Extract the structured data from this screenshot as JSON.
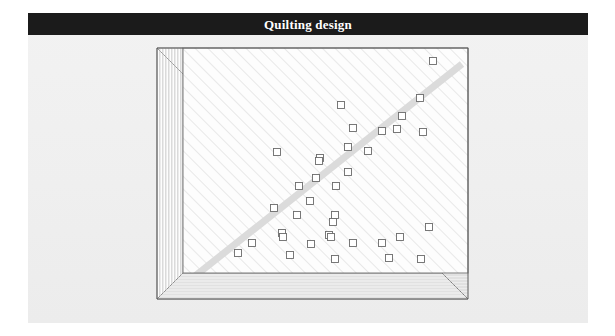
{
  "page": {
    "background_color": "#ffffff",
    "panel_color": "#f0f0f0",
    "width": 615,
    "height": 336
  },
  "titlebar": {
    "title": "Quilting design",
    "background_color": "#1b1b1b",
    "text_color": "#ffffff"
  },
  "diagram": {
    "name": "quilt-layout-diagram",
    "outline_color": "#555555",
    "hatch_color": "#e2e2e2",
    "field_color": "#fdfdfd",
    "border_strip_color": "#fcfcfc",
    "stitch_band_color": "#dadada",
    "square_stroke_color": "#6b6b6b",
    "square_fill_color": "#ffffff",
    "square_size": 7,
    "geometry": {
      "outer": {
        "x": 7,
        "y": 6,
        "w": 311,
        "h": 251
      },
      "field": {
        "x": 33,
        "y": 6,
        "w": 285,
        "h": 225
      },
      "left_border": {
        "x": 7,
        "y": 6,
        "w": 26,
        "h": 251
      },
      "bottom_border": {
        "x": 7,
        "y": 231,
        "w": 311,
        "h": 26
      },
      "hatch_spacing": 9,
      "hatch_angle_deg": 45,
      "left_border_line_count": 9,
      "bottom_border_line_count": 9
    },
    "stitch_band": {
      "x1": 40,
      "y1": 238,
      "x2": 312,
      "y2": 22,
      "width": 7
    },
    "squares": [
      {
        "x": 433,
        "y": 61
      },
      {
        "x": 420,
        "y": 98
      },
      {
        "x": 341,
        "y": 105
      },
      {
        "x": 402,
        "y": 116
      },
      {
        "x": 353,
        "y": 128
      },
      {
        "x": 382,
        "y": 131
      },
      {
        "x": 397,
        "y": 129
      },
      {
        "x": 423,
        "y": 132
      },
      {
        "x": 348,
        "y": 147
      },
      {
        "x": 368,
        "y": 151
      },
      {
        "x": 320,
        "y": 158
      },
      {
        "x": 277,
        "y": 152
      },
      {
        "x": 319,
        "y": 161
      },
      {
        "x": 348,
        "y": 172
      },
      {
        "x": 316,
        "y": 178
      },
      {
        "x": 299,
        "y": 186
      },
      {
        "x": 336,
        "y": 186
      },
      {
        "x": 310,
        "y": 201
      },
      {
        "x": 274,
        "y": 208
      },
      {
        "x": 297,
        "y": 215
      },
      {
        "x": 335,
        "y": 215
      },
      {
        "x": 282,
        "y": 233
      },
      {
        "x": 329,
        "y": 235
      },
      {
        "x": 333,
        "y": 222
      },
      {
        "x": 429,
        "y": 227
      },
      {
        "x": 283,
        "y": 237
      },
      {
        "x": 252,
        "y": 243
      },
      {
        "x": 331,
        "y": 237
      },
      {
        "x": 400,
        "y": 237
      },
      {
        "x": 311,
        "y": 244
      },
      {
        "x": 353,
        "y": 243
      },
      {
        "x": 382,
        "y": 243
      },
      {
        "x": 238,
        "y": 253
      },
      {
        "x": 290,
        "y": 255
      },
      {
        "x": 335,
        "y": 259
      },
      {
        "x": 389,
        "y": 258
      },
      {
        "x": 421,
        "y": 259
      }
    ]
  }
}
